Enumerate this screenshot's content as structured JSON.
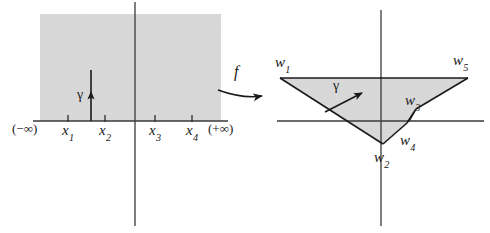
{
  "figure": {
    "kind": "mathematical-diagram",
    "background_color": "#ffffff",
    "shade_color": "#d9d9d9",
    "line_color": "#3a3a3a",
    "text_color": "#1a1a1a"
  },
  "left_panel": {
    "name": "domain-half-plane",
    "axis": {
      "horizontal_label_left": "(−∞)",
      "horizontal_label_right": "(+∞)"
    },
    "tick_labels": [
      {
        "base": "x",
        "sub": "1"
      },
      {
        "base": "x",
        "sub": "2"
      },
      {
        "base": "x",
        "sub": "3"
      },
      {
        "base": "x",
        "sub": "4"
      }
    ],
    "curve_label": "γ"
  },
  "map_arrow": {
    "name": "map-arrow",
    "label": "f"
  },
  "right_panel": {
    "name": "image-triangle-region",
    "vertex_labels": [
      {
        "base": "w",
        "sub": "1"
      },
      {
        "base": "w",
        "sub": "2"
      },
      {
        "base": "w",
        "sub": "3"
      },
      {
        "base": "w",
        "sub": "4"
      },
      {
        "base": "w",
        "sub": "5"
      }
    ],
    "curve_label": "γ"
  }
}
